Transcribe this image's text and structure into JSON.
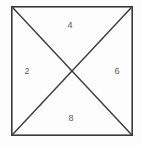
{
  "figure": {
    "name": "square-with-diagonals",
    "background_color": "#fdfdfd",
    "stroke_color": "#3a3a3a",
    "label_color": "#5a5a5a",
    "square": {
      "left": 11,
      "top": 6,
      "right": 133,
      "bottom": 136,
      "stroke_width": 1.6
    },
    "diagonals": {
      "stroke_width": 1.4,
      "intersection": {
        "x": 72,
        "y": 71
      }
    },
    "labels": {
      "top": "4",
      "left": "2",
      "right": "6",
      "bottom": "8"
    }
  },
  "chart_data": {
    "type": "diagram",
    "title": "",
    "shape": "square",
    "partition": "two diagonals forming four triangles",
    "regions": [
      {
        "position": "top",
        "label": "4"
      },
      {
        "position": "left",
        "label": "2"
      },
      {
        "position": "right",
        "label": "6"
      },
      {
        "position": "bottom",
        "label": "8"
      }
    ],
    "values": [
      4,
      2,
      6,
      8
    ],
    "categories": [
      "top",
      "left",
      "right",
      "bottom"
    ]
  }
}
